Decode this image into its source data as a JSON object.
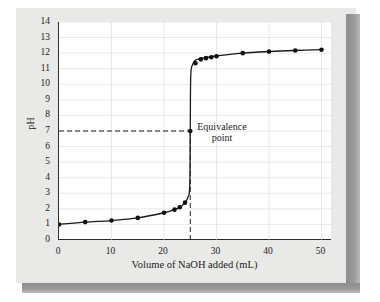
{
  "figure": {
    "annotation_line1": "Equivalence",
    "annotation_line2": "point",
    "colors": {
      "panel": "#e9e9e7",
      "plot_bg": "#ffffff",
      "axis": "#2b2b2b",
      "grid": "#d9d9d9",
      "curve": "#1a1a1a",
      "marker": "#111111",
      "dashed": "#222222",
      "shadow": "#8d8d8d"
    }
  },
  "chart_data": {
    "type": "line",
    "title": "",
    "xlabel": "Volume of NaOH added (mL)",
    "ylabel": "pH",
    "xlim": [
      0,
      52
    ],
    "ylim": [
      0,
      14
    ],
    "grid": true,
    "legend": "none",
    "xticks": [
      0,
      10,
      20,
      30,
      40,
      50
    ],
    "yticks": [
      0,
      1,
      2,
      3,
      4,
      5,
      6,
      7,
      8,
      9,
      10,
      11,
      12,
      13,
      14
    ],
    "xtick_labels": [
      "0",
      "10",
      "20",
      "30",
      "40",
      "50"
    ],
    "ytick_labels": [
      "0",
      "1",
      "2",
      "3",
      "4",
      "5",
      "6",
      "7",
      "8",
      "9",
      "10",
      "11",
      "12",
      "13",
      "14"
    ],
    "x": [
      0,
      5,
      10,
      15,
      20,
      22,
      23,
      24,
      24.5,
      24.9,
      25,
      25.1,
      25.5,
      26,
      27,
      28,
      29,
      30,
      35,
      40,
      45,
      50
    ],
    "y": [
      1.0,
      1.15,
      1.25,
      1.42,
      1.75,
      1.95,
      2.1,
      2.4,
      2.7,
      3.4,
      7.0,
      10.6,
      11.3,
      11.55,
      11.65,
      11.72,
      11.78,
      11.82,
      12.0,
      12.1,
      12.17,
      12.22
    ],
    "markers_x": [
      0,
      5,
      10,
      15,
      20,
      22,
      23,
      24,
      25,
      26,
      27,
      28,
      29,
      30,
      35,
      40,
      45,
      50
    ],
    "markers_y": [
      1.0,
      1.15,
      1.25,
      1.42,
      1.75,
      1.95,
      2.1,
      2.4,
      7.0,
      11.35,
      11.6,
      11.68,
      11.74,
      11.8,
      12.0,
      12.1,
      12.17,
      12.22
    ],
    "annotations": [
      {
        "label": "Equivalence point",
        "x": 25,
        "y": 7.0,
        "guide_horizontal": true,
        "guide_vertical": true
      }
    ]
  }
}
